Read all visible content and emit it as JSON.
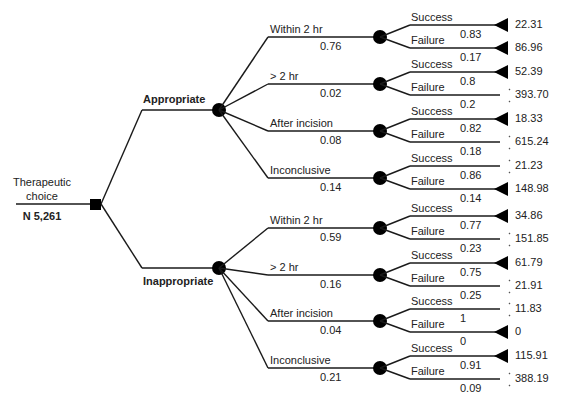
{
  "root": {
    "label_line1": "Therapeutic",
    "label_line2": "choice",
    "n_label": "N 5,261"
  },
  "branches": [
    {
      "label": "Appropriate",
      "timings": [
        {
          "label": "Within 2 hr",
          "prob": "0.76",
          "outcomes": [
            {
              "label": "Success",
              "prob": "0.83",
              "value": "22.31",
              "marker": "triangle"
            },
            {
              "label": "Failure",
              "prob": "0.17",
              "value": "86.96",
              "marker": "triangle"
            }
          ]
        },
        {
          "label": "> 2 hr",
          "prob": "0.02",
          "outcomes": [
            {
              "label": "Success",
              "prob": "0.8",
              "value": "52.39",
              "marker": "triangle"
            },
            {
              "label": "Failure",
              "prob": "0.2",
              "value": "393.70",
              "marker": "tick"
            }
          ]
        },
        {
          "label": "After incision",
          "prob": "0.08",
          "outcomes": [
            {
              "label": "Success",
              "prob": "0.82",
              "value": "18.33",
              "marker": "triangle"
            },
            {
              "label": "Failure",
              "prob": "0.18",
              "value": "615.24",
              "marker": "tick"
            }
          ]
        },
        {
          "label": "Inconclusive",
          "prob": "0.14",
          "outcomes": [
            {
              "label": "Success",
              "prob": "0.86",
              "value": "21.23",
              "marker": "tick"
            },
            {
              "label": "Failure",
              "prob": "0.14",
              "value": "148.98",
              "marker": "triangle"
            }
          ]
        }
      ]
    },
    {
      "label": "Inappropriate",
      "timings": [
        {
          "label": "Within 2 hr",
          "prob": "0.59",
          "outcomes": [
            {
              "label": "Success",
              "prob": "0.77",
              "value": "34.86",
              "marker": "triangle"
            },
            {
              "label": "Failure",
              "prob": "0.23",
              "value": "151.85",
              "marker": "tick"
            }
          ]
        },
        {
          "label": "> 2 hr",
          "prob": "0.16",
          "outcomes": [
            {
              "label": "Success",
              "prob": "0.75",
              "value": "61.79",
              "marker": "triangle"
            },
            {
              "label": "Failure",
              "prob": "0.25",
              "value": "21.91",
              "marker": "tick"
            }
          ]
        },
        {
          "label": "After incision",
          "prob": "0.04",
          "outcomes": [
            {
              "label": "Success",
              "prob": "1",
              "value": "11.83",
              "marker": "tick"
            },
            {
              "label": "Failure",
              "prob": "0",
              "value": "0",
              "marker": "triangle"
            }
          ]
        },
        {
          "label": "Inconclusive",
          "prob": "0.21",
          "outcomes": [
            {
              "label": "Success",
              "prob": "0.91",
              "value": "115.91",
              "marker": "triangle"
            },
            {
              "label": "Failure",
              "prob": "0.09",
              "value": "388.19",
              "marker": "tick"
            }
          ]
        }
      ]
    }
  ],
  "colors": {
    "line": "#1a1a1a",
    "node": "#000000",
    "text": "#222222"
  }
}
